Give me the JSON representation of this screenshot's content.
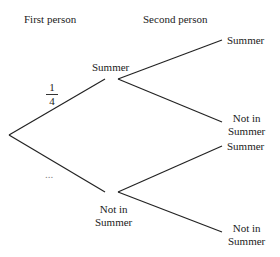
{
  "headers": {
    "first": "First person",
    "second": "Second person"
  },
  "level1": {
    "upper": "Summer",
    "lower_line1": "Not in",
    "lower_line2": "Summer",
    "upper_prob_num": "1",
    "upper_prob_den": "4",
    "lower_prob": "..."
  },
  "level2": {
    "uu": "Summer",
    "ul_line1": "Not in",
    "ul_line2": "Summer",
    "lu": "Summer",
    "ll_line1": "Not in",
    "ll_line2": "Summer"
  },
  "colors": {
    "line": "#222222",
    "text": "#222222"
  }
}
